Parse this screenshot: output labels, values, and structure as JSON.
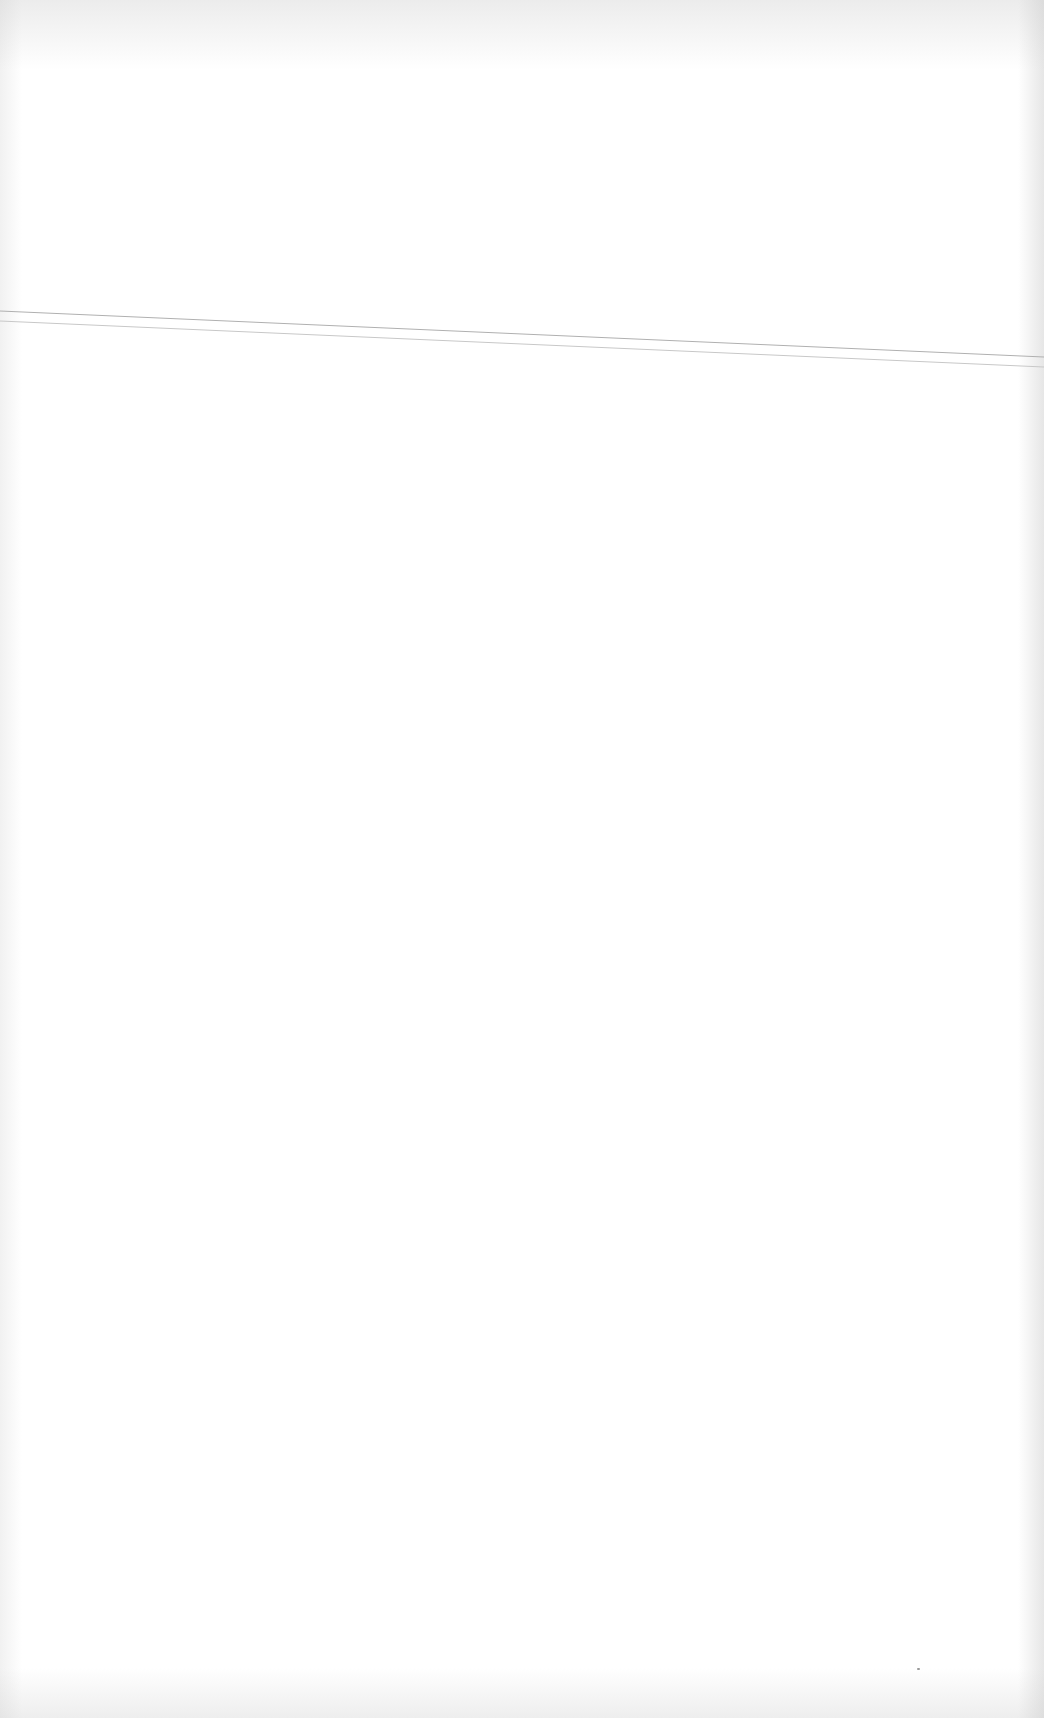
{
  "document": {
    "type": "blank scanned page",
    "text": "",
    "rule_lines": [
      {
        "x1": 0,
        "y1": 311,
        "x2": 1044,
        "y2": 357,
        "color": "#b0b0b0"
      },
      {
        "x1": 0,
        "y1": 321,
        "x2": 1044,
        "y2": 367,
        "color": "#c8c8c8"
      }
    ],
    "speck": {
      "x": 918,
      "y": 1668,
      "color": "#9a9a9a"
    },
    "colors": {
      "paper": "#ffffff",
      "edge_shading": "#d0d0d0"
    }
  }
}
